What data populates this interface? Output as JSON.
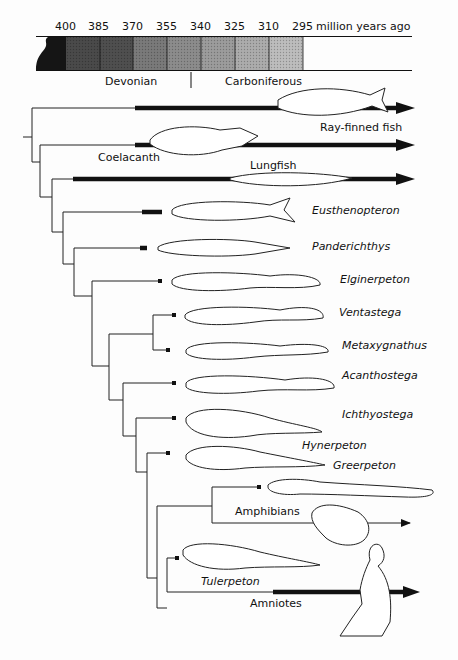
{
  "timescale": {
    "ticks": [
      "400",
      "385",
      "370",
      "355",
      "340",
      "325",
      "310",
      "295"
    ],
    "unit_label": "million years ago",
    "periods": [
      "Devonian",
      "Carboniferous"
    ]
  },
  "taxa": [
    {
      "name": "Ray-finned fish",
      "italic": false
    },
    {
      "name": "Coelacanth",
      "italic": false
    },
    {
      "name": "Lungfish",
      "italic": false
    },
    {
      "name": "Eusthenopteron",
      "italic": true
    },
    {
      "name": "Panderichthys",
      "italic": true
    },
    {
      "name": "Elginerpeton",
      "italic": true
    },
    {
      "name": "Ventastega",
      "italic": true
    },
    {
      "name": "Metaxygnathus",
      "italic": true
    },
    {
      "name": "Acanthostega",
      "italic": true
    },
    {
      "name": "Ichthyostega",
      "italic": true
    },
    {
      "name": "Hynerpeton",
      "italic": true
    },
    {
      "name": "Greerpeton",
      "italic": true
    },
    {
      "name": "Amphibians",
      "italic": false
    },
    {
      "name": "Tulerpeton",
      "italic": true
    },
    {
      "name": "Amniotes",
      "italic": false
    }
  ]
}
